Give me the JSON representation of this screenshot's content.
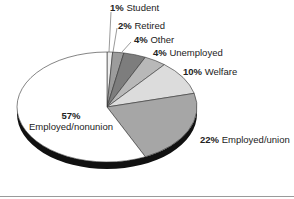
{
  "chart_data": {
    "type": "pie",
    "title": "",
    "style": "3d-tilted",
    "start_angle": "12 o'clock",
    "direction": "clockwise",
    "slices": [
      {
        "label": "Student",
        "value": 1,
        "pct_text": "1%",
        "color": "#eeeeee"
      },
      {
        "label": "Retired",
        "value": 2,
        "pct_text": "2%",
        "color": "#9c9c9c"
      },
      {
        "label": "Other",
        "value": 4,
        "pct_text": "4%",
        "color": "#7d7d7d"
      },
      {
        "label": "Unemployed",
        "value": 4,
        "pct_text": "4%",
        "color": "#b8b8b8"
      },
      {
        "label": "Welfare",
        "value": 10,
        "pct_text": "10%",
        "color": "#dcdcdc"
      },
      {
        "label": "Employed/union",
        "value": 22,
        "pct_text": "22%",
        "color": "#a6a6a6"
      },
      {
        "label": "Employed/nonunion",
        "value": 57,
        "pct_text": "57%",
        "color": "#ffffff"
      }
    ]
  },
  "labels": {
    "student": {
      "pct": "1%",
      "name": "Student"
    },
    "retired": {
      "pct": "2%",
      "name": "Retired"
    },
    "other": {
      "pct": "4%",
      "name": "Other"
    },
    "unemployed": {
      "pct": "4%",
      "name": "Unemployed"
    },
    "welfare": {
      "pct": "10%",
      "name": "Welfare"
    },
    "union": {
      "pct": "22%",
      "name": "Employed/union"
    },
    "nonunion": {
      "pct": "57%",
      "name": "Employed/nonunion"
    }
  }
}
